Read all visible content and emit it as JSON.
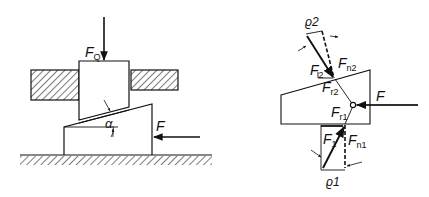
{
  "diagram": {
    "left": {
      "title": "wedge-mechanism",
      "labels": {
        "load_force": "F",
        "load_force_sub": "Q",
        "drive_force": "F",
        "angle": "α"
      }
    },
    "right": {
      "title": "free-body-diagram",
      "labels": {
        "rho2": "ϱ2",
        "rho1": "ϱ1",
        "F2": "F",
        "F2_sub": "2",
        "Fn2": "F",
        "Fn2_sub": "n2",
        "Fr2": "F",
        "Fr2_sub": "r2",
        "Fr1": "F",
        "Fr1_sub": "r1",
        "F1": "F",
        "F1_sub": "1",
        "Fn1": "F",
        "Fn1_sub": "n1",
        "drive_force": "F"
      }
    },
    "colors": {
      "line": "#111111",
      "background": "#ffffff"
    }
  }
}
